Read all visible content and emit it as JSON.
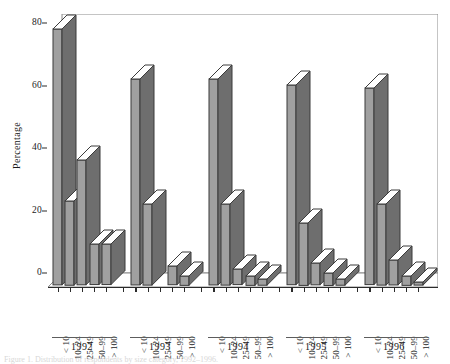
{
  "figure": {
    "caption": "Figure 1. Distribution of respondents by size category, 1992–1996."
  },
  "chart_data": {
    "type": "bar",
    "title": "",
    "xlabel": "",
    "ylabel": "Percentage",
    "ylim": [
      0,
      83
    ],
    "yticks": [
      0,
      20,
      40,
      60,
      80
    ],
    "ytick_labels": [
      "0",
      "20",
      "40",
      "60",
      "80"
    ],
    "grid": false,
    "legend": "none",
    "style": "3d-column",
    "group_labels": [
      "1992",
      "1993",
      "1994",
      "1995",
      "1996"
    ],
    "categories": [
      "< 10",
      "10–24",
      "25–49",
      "50–99",
      "> 100"
    ],
    "series": [
      {
        "name": "1992",
        "values": [
          82,
          27,
          40,
          13,
          13
        ]
      },
      {
        "name": "1993",
        "values": [
          66,
          26,
          0,
          6,
          3
        ]
      },
      {
        "name": "1994",
        "values": [
          66,
          26,
          5,
          3,
          2
        ]
      },
      {
        "name": "1995",
        "values": [
          64,
          20,
          7,
          4,
          2
        ]
      },
      {
        "name": "1996",
        "values": [
          63,
          26,
          8,
          3,
          1
        ]
      }
    ],
    "colors": {
      "bar_face": "#a0a0a0",
      "bar_top": "#ffffff",
      "bar_side": "#6e6e6e",
      "axis": "#2b2b2b",
      "background": "#ffffff"
    }
  }
}
